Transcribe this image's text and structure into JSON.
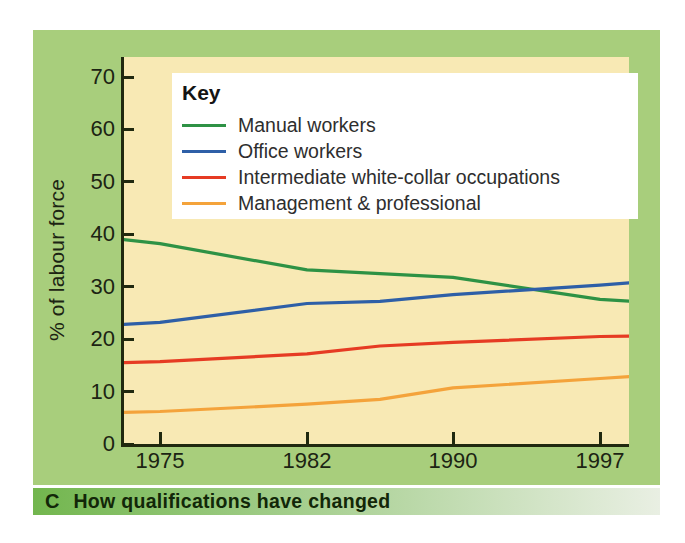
{
  "legend": {
    "title": "Key"
  },
  "caption": {
    "letter": "C",
    "text": "How qualifications have changed"
  },
  "colors": {
    "card_bg": "#a8ce7c",
    "plot_bg": "#f8e9b4",
    "axis": "#20290f",
    "tick_text": "#1c2413",
    "legend_text": "#2e2e2e",
    "caption_text": "#122708",
    "caption_grad_start": "#72b64e",
    "caption_grad_end": "#e9efe3"
  },
  "chart_data": {
    "type": "line",
    "title": "How qualifications have changed",
    "xlabel": "",
    "ylabel": "% of labour force",
    "ylim": [
      0,
      73
    ],
    "xlim": [
      1973.2,
      1998.6
    ],
    "yticks": [
      0,
      10,
      20,
      30,
      40,
      50,
      60,
      70
    ],
    "xticks": [
      "1975",
      "1982",
      "1990",
      "1997"
    ],
    "grid": false,
    "legend_position": "top-left overlay inside plot",
    "series": [
      {
        "name": "Manual workers",
        "color": "#2e9245",
        "points": [
          [
            1973.2,
            39.0
          ],
          [
            1975,
            38.2
          ],
          [
            1982,
            33.2
          ],
          [
            1990,
            31.8
          ],
          [
            1997,
            27.6
          ],
          [
            1998.6,
            27.2
          ]
        ]
      },
      {
        "name": "Office workers",
        "color": "#2e5fa7",
        "points": [
          [
            1973.2,
            22.8
          ],
          [
            1975,
            23.2
          ],
          [
            1982,
            26.8
          ],
          [
            1986,
            27.2
          ],
          [
            1990,
            28.5
          ],
          [
            1997,
            30.3
          ],
          [
            1998.6,
            30.8
          ]
        ]
      },
      {
        "name": "Intermediate white-collar occupations",
        "color": "#e63b23",
        "points": [
          [
            1973.2,
            15.5
          ],
          [
            1975,
            15.7
          ],
          [
            1982,
            17.2
          ],
          [
            1986,
            18.7
          ],
          [
            1990,
            19.4
          ],
          [
            1997,
            20.5
          ],
          [
            1998.6,
            20.6
          ]
        ]
      },
      {
        "name": "Management & professional",
        "color": "#f4a33b",
        "points": [
          [
            1973.2,
            6.0
          ],
          [
            1975,
            6.2
          ],
          [
            1982,
            7.6
          ],
          [
            1986,
            8.5
          ],
          [
            1990,
            10.7
          ],
          [
            1997,
            12.5
          ],
          [
            1998.6,
            12.9
          ]
        ]
      }
    ]
  }
}
